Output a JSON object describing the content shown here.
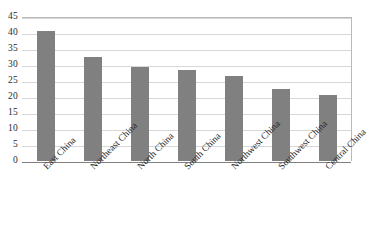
{
  "chart_data": {
    "type": "bar",
    "title": "",
    "subtitle": "",
    "xlabel": "",
    "ylabel": "",
    "categories": [
      "East China",
      "Northeast China",
      "North China",
      "South China",
      "Northwest China",
      "Southwest China",
      "Central China"
    ],
    "values": [
      40.7,
      32.5,
      29.4,
      28.3,
      26.7,
      22.5,
      20.7
    ],
    "ylim": [
      0,
      45
    ],
    "ytick_labels": [
      "45",
      "40",
      "35",
      "30",
      "25",
      "20",
      "15",
      "10",
      "5",
      "0"
    ],
    "yticks": [
      45,
      40,
      35,
      30,
      25,
      20,
      15,
      10,
      5,
      0
    ],
    "grid": true,
    "legend": false,
    "legend_position": "none",
    "series": [
      {
        "name": "",
        "values": [
          40.7,
          32.5,
          29.4,
          28.3,
          26.7,
          22.5,
          20.7
        ]
      }
    ],
    "colors": {
      "bar_fill": "#808080",
      "gridline": "#d7d7d7",
      "axis_line": "#7f7f7f",
      "frame": "#b9b9b9",
      "text": "#2b2b2b",
      "background": "#ffffff"
    }
  }
}
